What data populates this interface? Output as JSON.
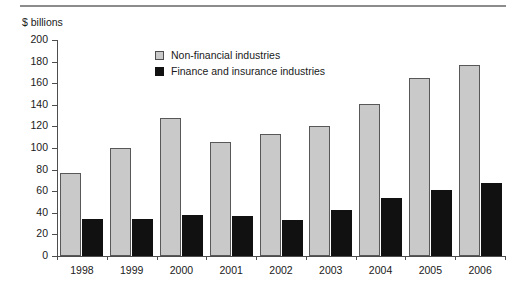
{
  "chart_data": {
    "type": "bar",
    "title": "",
    "subtitle": "",
    "xlabel": "",
    "ylabel": "$ billions",
    "unit_label": "$ billions",
    "categories": [
      "1998",
      "1999",
      "2000",
      "2001",
      "2002",
      "2003",
      "2004",
      "2005",
      "2006"
    ],
    "series": [
      {
        "name": "Non-financial industries",
        "color": "#c9c9c9",
        "values": [
          77,
          100,
          128,
          106,
          113,
          120,
          141,
          165,
          177
        ]
      },
      {
        "name": "Finance and insurance industries",
        "color": "#111111",
        "values": [
          34,
          34,
          38,
          37,
          33,
          43,
          54,
          61,
          68
        ]
      }
    ],
    "ylim": [
      0,
      200
    ],
    "yticks": [
      0,
      20,
      40,
      60,
      80,
      100,
      120,
      140,
      160,
      180,
      200
    ],
    "ytick_labels": [
      "0",
      "20",
      "40",
      "60",
      "80",
      "100",
      "120",
      "140",
      "160",
      "180",
      "200"
    ],
    "grid": false,
    "legend_position": "upper-center",
    "legend": [
      {
        "label": "Non-financial industries",
        "swatch": "light-square",
        "color": "#c9c9c9"
      },
      {
        "label": "Finance and insurance industries",
        "swatch": "dark-square",
        "color": "#111111"
      }
    ]
  },
  "decor": {
    "top_rule_color": "#8c8c8c",
    "axis_color": "#4d4d4d"
  }
}
